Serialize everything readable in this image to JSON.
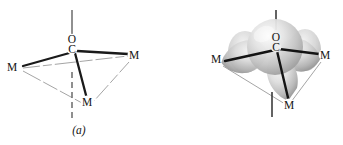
{
  "figure": {
    "type": "chemical-structure-diagram",
    "background_color": "#ffffff",
    "ink_color": "#141414",
    "bond_color": "#1a1a1a",
    "frame_color": "#9a9a9a",
    "axis_color": "#6b6b6b",
    "orbital_fill_light": "#f2f2f2",
    "orbital_fill_mid": "#c9c9c9",
    "orbital_fill_dark": "#8d8d8d"
  },
  "panels": [
    {
      "id": "a",
      "caption": "(a)",
      "description": "Skeletal geometry of mu3-CO bridging three metal centers",
      "labels": [
        {
          "name": "oxygen",
          "text": "O",
          "x": 72,
          "y": 42
        },
        {
          "name": "carbon",
          "text": "C",
          "x": 72,
          "y": 52
        },
        {
          "name": "metal-left",
          "text": "M",
          "x": 11,
          "y": 70
        },
        {
          "name": "metal-right",
          "text": "M",
          "x": 133,
          "y": 58
        },
        {
          "name": "metal-front",
          "text": "M",
          "x": 86,
          "y": 105
        }
      ],
      "axis": {
        "name": "c3-axis",
        "top_solid": {
          "x1": 72,
          "y1": 10,
          "x2": 72,
          "y2": 36
        },
        "bottom_dashed": {
          "x1": 72,
          "y1": 72,
          "x2": 72,
          "y2": 121
        }
      },
      "bonds": [
        {
          "from": "C",
          "to": "metal-left",
          "style": "solid-thick"
        },
        {
          "from": "C",
          "to": "metal-right",
          "style": "solid-thick"
        },
        {
          "from": "C",
          "to": "metal-front",
          "style": "solid-thick"
        }
      ],
      "metal_frame": [
        {
          "from": "metal-left",
          "to": "metal-right",
          "style": "thin-gray"
        },
        {
          "from": "metal-left",
          "to": "metal-front",
          "style": "thin-gray"
        },
        {
          "from": "metal-right",
          "to": "metal-front",
          "style": "thin-gray"
        }
      ]
    },
    {
      "id": "b",
      "caption": "(b)",
      "description": "Same geometry with carbonyl pi* and metal orbital lobes shown as shaded three-dimensional surfaces",
      "labels": [
        {
          "name": "oxygen",
          "text": "O",
          "x": 105,
          "y": 40
        },
        {
          "name": "carbon",
          "text": "C",
          "x": 105,
          "y": 50
        },
        {
          "name": "metal-left",
          "text": "M",
          "x": 44,
          "y": 62
        },
        {
          "name": "metal-right",
          "text": "M",
          "x": 153,
          "y": 58
        },
        {
          "name": "metal-front",
          "text": "M",
          "x": 117,
          "y": 108
        }
      ],
      "axis": {
        "name": "c3-axis",
        "top_solid": {
          "x1": 105,
          "y1": 10,
          "x2": 105,
          "y2": 30
        },
        "bottom_solid": {
          "x1": 101,
          "y1": 92,
          "x2": 101,
          "y2": 117
        }
      },
      "orbitals": [
        {
          "name": "central-sphere",
          "shape": "sphere"
        },
        {
          "name": "lobe-left",
          "shape": "teardrop",
          "points_toward": "metal-left"
        },
        {
          "name": "lobe-right",
          "shape": "teardrop",
          "points_toward": "metal-right"
        },
        {
          "name": "lobe-front",
          "shape": "teardrop",
          "points_toward": "metal-front"
        }
      ],
      "bonds": [
        {
          "from": "C",
          "to": "metal-left",
          "style": "solid-thick"
        },
        {
          "from": "C",
          "to": "metal-right",
          "style": "solid-thick"
        },
        {
          "from": "C",
          "to": "metal-front",
          "style": "solid-thick"
        }
      ],
      "metal_frame": [
        {
          "from": "metal-left",
          "to": "metal-right",
          "style": "thin-gray"
        },
        {
          "from": "metal-left",
          "to": "metal-front",
          "style": "thin-gray"
        },
        {
          "from": "metal-right",
          "to": "metal-front",
          "style": "thin-gray"
        }
      ]
    }
  ]
}
